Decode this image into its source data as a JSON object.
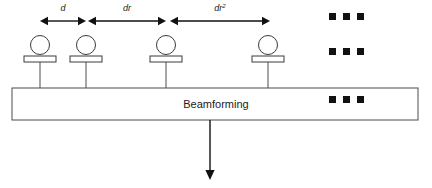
{
  "figure": {
    "title_text": "",
    "background_color": "#ffffff",
    "line_color": "#3a3a3a",
    "arrow_color": "#111111",
    "text_color": "#1a1a1a"
  },
  "spacing_labels": [
    {
      "id": "spacing-1",
      "base": "d",
      "exponent": "",
      "x": 63,
      "y": 11
    },
    {
      "id": "spacing-2",
      "base": "dr",
      "exponent": "",
      "x": 127,
      "y": 11
    },
    {
      "id": "spacing-3",
      "base": "dr",
      "exponent": "2",
      "x": 220,
      "y": 11
    }
  ],
  "spacing_arrows": [
    {
      "id": "arrow-d",
      "x1": 40,
      "x2": 86,
      "y": 21
    },
    {
      "id": "arrow-dr",
      "x1": 88,
      "x2": 166,
      "y": 21
    },
    {
      "id": "arrow-dr2",
      "x1": 170,
      "x2": 270,
      "y": 21
    }
  ],
  "antennas": [
    {
      "id": "antenna-1",
      "cx": 40,
      "label": "antenna-element-1"
    },
    {
      "id": "antenna-2",
      "cx": 86,
      "label": "antenna-element-2"
    },
    {
      "id": "antenna-3",
      "cx": 166,
      "label": "antenna-element-3"
    },
    {
      "id": "antenna-4",
      "cx": 268,
      "label": "antenna-element-4"
    }
  ],
  "antenna_geometry": {
    "circle_cy": 45,
    "circle_r": 9.5,
    "plate_y": 56,
    "plate_h": 6,
    "plate_w": 32,
    "stem_top": 62,
    "stem_bottom": 88
  },
  "beamforming_box": {
    "label": "Beamforming",
    "x": 12,
    "y": 88,
    "width": 406,
    "height": 32,
    "label_x": 216,
    "label_y": 108
  },
  "output_arrow": {
    "id": "output-arrow",
    "x": 210,
    "y_top": 120,
    "y_bottom": 180,
    "description": "beamformed-output"
  },
  "ellipsis_groups": [
    {
      "id": "ellipsis-top",
      "y": 13,
      "xs": [
        329,
        343,
        357
      ],
      "size": 7
    },
    {
      "id": "ellipsis-middle",
      "y": 48,
      "xs": [
        329,
        343,
        357
      ],
      "size": 7
    },
    {
      "id": "ellipsis-box",
      "y": 96,
      "xs": [
        329,
        343,
        357
      ],
      "size": 7
    }
  ]
}
